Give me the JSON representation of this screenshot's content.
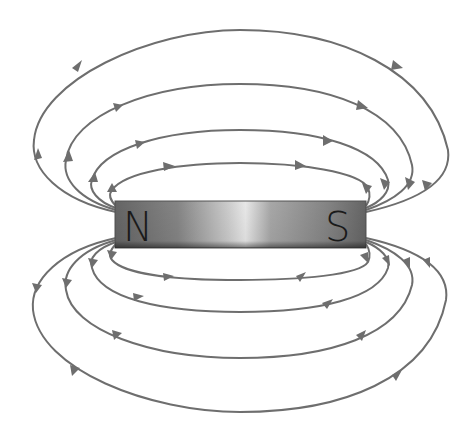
{
  "diagram": {
    "magnet": {
      "north_label": "N",
      "south_label": "S"
    },
    "field_line_color": "#6e6e6e",
    "field_lines": {
      "top_loops": 4,
      "bottom_loops": 4,
      "direction": "from N pole to S pole outside the magnet"
    }
  }
}
